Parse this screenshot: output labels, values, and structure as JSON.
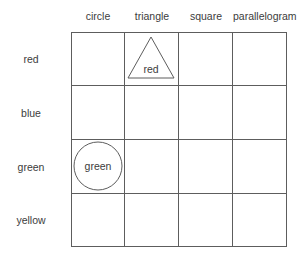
{
  "diagram": {
    "background_color": "#ffffff",
    "line_color": "#5d5d5d",
    "text_color": "#3c3c3c"
  },
  "columns": [
    {
      "key": "circle",
      "label": "circle"
    },
    {
      "key": "triangle",
      "label": "triangle"
    },
    {
      "key": "square",
      "label": "square"
    },
    {
      "key": "parallelogram",
      "label": "parallelogram"
    }
  ],
  "rows": [
    {
      "key": "red",
      "label": "red"
    },
    {
      "key": "blue",
      "label": "blue"
    },
    {
      "key": "green",
      "label": "green"
    },
    {
      "key": "yellow",
      "label": "yellow"
    }
  ],
  "cells": [
    {
      "row": "red",
      "column": "triangle",
      "shape": "triangle",
      "label": "red",
      "filled": false,
      "outline_color": "#5d5d5d"
    },
    {
      "row": "green",
      "column": "circle",
      "shape": "circle",
      "label": "green",
      "filled": false,
      "outline_color": "#5d5d5d"
    }
  ]
}
